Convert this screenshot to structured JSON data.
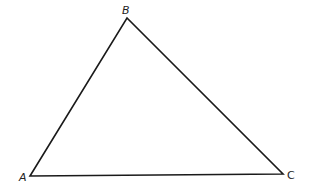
{
  "diagram": {
    "type": "triangle",
    "vertices": [
      {
        "name": "A",
        "x": 30,
        "y": 176,
        "label_x": 19,
        "label_y": 181
      },
      {
        "name": "B",
        "x": 127,
        "y": 18,
        "label_x": 122,
        "label_y": 14
      },
      {
        "name": "C",
        "x": 283,
        "y": 174,
        "label_x": 287,
        "label_y": 179
      }
    ],
    "stroke_color": "#1a1a1a",
    "background": "#ffffff"
  }
}
